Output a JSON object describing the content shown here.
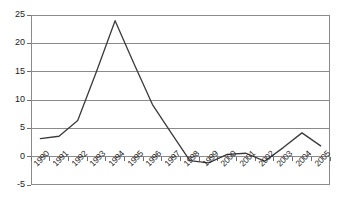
{
  "chart_data": {
    "type": "line",
    "title": "",
    "xlabel": "",
    "ylabel": "",
    "categories": [
      "1990",
      "1991",
      "1992",
      "1993",
      "1994",
      "1995",
      "1996",
      "1997",
      "1998",
      "1999",
      "2000",
      "2001",
      "2002",
      "2003",
      "2004",
      "2005"
    ],
    "values": [
      3.2,
      3.6,
      6.4,
      15.0,
      24.0,
      16.5,
      9.2,
      4.2,
      -0.7,
      -1.1,
      0.4,
      0.6,
      -0.8,
      1.6,
      4.2,
      1.9
    ],
    "ylim": [
      -5,
      25
    ],
    "yticks": [
      -5,
      0,
      5,
      10,
      15,
      20,
      25
    ],
    "ytick_labels": [
      "-5",
      "0",
      "5",
      "10",
      "15",
      "20",
      "25"
    ],
    "grid": true,
    "grid_axis": "y",
    "legend": false,
    "legend_position": "none",
    "line_color": "#3a3a3a",
    "grid_color": "#8a8a8a",
    "axis_color": "#6e6e6e",
    "background_color": "#ffffff",
    "xtick_rotation": -45,
    "series": [
      {
        "name": "series-1",
        "values": [
          3.2,
          3.6,
          6.4,
          15.0,
          24.0,
          16.5,
          9.2,
          4.2,
          -0.7,
          -1.1,
          0.4,
          0.6,
          -0.8,
          1.6,
          4.2,
          1.9
        ]
      }
    ]
  }
}
